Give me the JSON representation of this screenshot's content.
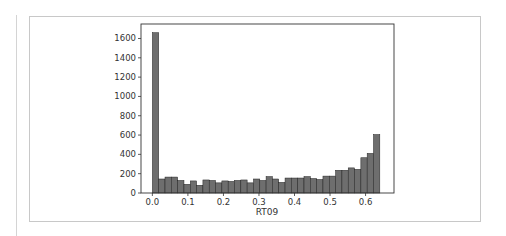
{
  "chart_data": {
    "type": "bar",
    "title": "",
    "xlabel": "RT09",
    "ylabel": "",
    "xlim": [
      -0.032,
      0.68
    ],
    "ylim": [
      0,
      1750
    ],
    "grid": false,
    "legend": null,
    "bin_start": 0.0,
    "bin_width": 0.01778,
    "x_ticks": [
      0.0,
      0.1,
      0.2,
      0.3,
      0.4,
      0.5,
      0.6
    ],
    "x_tick_labels": [
      "0.0",
      "0.1",
      "0.2",
      "0.3",
      "0.4",
      "0.5",
      "0.6"
    ],
    "y_ticks": [
      0,
      200,
      400,
      600,
      800,
      1000,
      1200,
      1400,
      1600
    ],
    "y_tick_labels": [
      "0",
      "200",
      "400",
      "600",
      "800",
      "1000",
      "1200",
      "1400",
      "1600"
    ],
    "bar_color": "#6e6e6e",
    "edge_color": "#222222",
    "values": [
      1660,
      145,
      165,
      165,
      130,
      90,
      125,
      80,
      135,
      130,
      105,
      125,
      120,
      130,
      135,
      105,
      145,
      130,
      170,
      145,
      110,
      155,
      155,
      155,
      170,
      150,
      140,
      175,
      175,
      235,
      235,
      260,
      245,
      365,
      410,
      605
    ]
  }
}
